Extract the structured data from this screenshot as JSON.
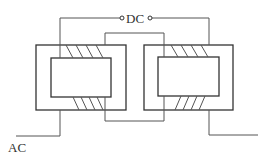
{
  "diagram": {
    "type": "magnetic-amplifier-schematic",
    "labels": {
      "dc": "DC",
      "ac": "AC"
    },
    "components": [
      {
        "name": "left-core",
        "outer": [
          36,
          45,
          126,
          110
        ],
        "inner": [
          51,
          58,
          111,
          97
        ]
      },
      {
        "name": "right-core",
        "outer": [
          144,
          45,
          233,
          110
        ],
        "inner": [
          158,
          57,
          219,
          96
        ]
      }
    ],
    "colors": {
      "line": "#555555",
      "core": "#333333",
      "background": "#ffffff"
    }
  }
}
